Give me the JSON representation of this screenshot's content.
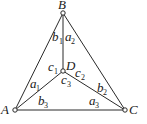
{
  "diagram": {
    "nodes": [
      {
        "id": "A",
        "label": "A",
        "x": 15,
        "y": 110
      },
      {
        "id": "B",
        "label": "B",
        "x": 63,
        "y": 13
      },
      {
        "id": "C",
        "label": "C",
        "x": 125,
        "y": 110
      },
      {
        "id": "D",
        "label": "D",
        "x": 63,
        "y": 71
      }
    ],
    "edges": [
      {
        "from": "A",
        "to": "B"
      },
      {
        "from": "B",
        "to": "C"
      },
      {
        "from": "A",
        "to": "C"
      },
      {
        "from": "B",
        "to": "D"
      },
      {
        "from": "A",
        "to": "D"
      },
      {
        "from": "C",
        "to": "D"
      }
    ],
    "angle_labels": [
      {
        "name": "b1",
        "letter": "b",
        "sub": "1"
      },
      {
        "name": "a2",
        "letter": "a",
        "sub": "2"
      },
      {
        "name": "c1",
        "letter": "c",
        "sub": "1"
      },
      {
        "name": "c2",
        "letter": "c",
        "sub": "2"
      },
      {
        "name": "c3",
        "letter": "c",
        "sub": "3"
      },
      {
        "name": "a1",
        "letter": "a",
        "sub": "1"
      },
      {
        "name": "b2",
        "letter": "b",
        "sub": "2"
      },
      {
        "name": "b3",
        "letter": "b",
        "sub": "3"
      },
      {
        "name": "a3",
        "letter": "a",
        "sub": "3"
      }
    ]
  }
}
